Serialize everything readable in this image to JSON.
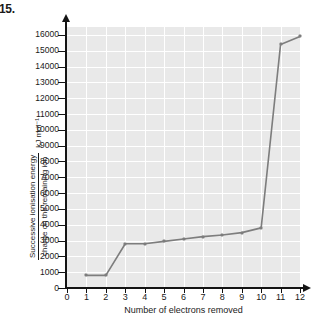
{
  "question_number": "15.",
  "chart_data": {
    "type": "line",
    "title": "",
    "xlabel": "Number of electrons removed",
    "ylabel_numerator": "Successive ionisation energy",
    "ylabel_denominator": "charge on the remaining ion",
    "ylabel_units": "kJ mol⁻¹",
    "x": [
      1,
      2,
      3,
      4,
      5,
      6,
      7,
      8,
      9,
      10,
      11,
      12
    ],
    "values": [
      800,
      800,
      2800,
      2800,
      2950,
      3100,
      3250,
      3350,
      3500,
      3800,
      15400,
      15900
    ],
    "xlim": [
      0,
      12
    ],
    "ylim": [
      0,
      16500
    ],
    "xticks": [
      "0",
      "1",
      "2",
      "3",
      "4",
      "5",
      "6",
      "7",
      "8",
      "9",
      "10",
      "11",
      "12"
    ],
    "yticks": [
      "0",
      "1000",
      "2000",
      "3000",
      "4000",
      "5000",
      "6000",
      "7000",
      "8000",
      "9000",
      "10000",
      "11000",
      "12000",
      "13000",
      "14000",
      "15000",
      "16000"
    ],
    "grid": true,
    "legend": "none",
    "line_color": "#7d7d7d",
    "plot_background": "#e9e9e9",
    "gridline_color": "#ffffff",
    "axis_color": "#141414"
  }
}
